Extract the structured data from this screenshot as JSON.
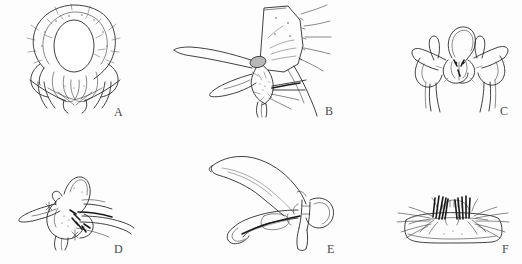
{
  "figure": {
    "type": "scientific-line-drawing-plate",
    "background_color": "#fdfdfd",
    "ink_color": "#2b2b2b",
    "rows": 2,
    "columns": 3,
    "width": 522,
    "height": 264,
    "panels": [
      {
        "label": "A",
        "subject": "head-capsule-frontal-view",
        "description": "rounded head capsule with large central oval opening and radiating setae below",
        "label_x": 114,
        "label_y": 106
      },
      {
        "label": "B",
        "subject": "maxilla-with-elongate-stylet",
        "description": "quadrangular plate bearing long curved tapering stylet and setose lower mouthparts",
        "label_x": 325,
        "label_y": 105
      },
      {
        "label": "C",
        "subject": "hypopharynx-symmetric-sclerite",
        "description": "bilaterally symmetric sclerite with central loop, lateral horn processes and two long descending setae",
        "label_x": 500,
        "label_y": 105
      },
      {
        "label": "D",
        "subject": "mouthpart-cluster-lateral-view",
        "description": "compact mouthpart cluster with pointed beak-like process and dark setae",
        "label_x": 114,
        "label_y": 243
      },
      {
        "label": "E",
        "subject": "mandible-lateral-view",
        "description": "elongate scythe-like mandible with rounded basal lobe and lower curved branch",
        "label_x": 327,
        "label_y": 243
      },
      {
        "label": "F",
        "subject": "labium-with-bristle-combs",
        "description": "broad rounded plate bearing two central combs of stout dark bristles and lateral setae",
        "label_x": 502,
        "label_y": 243
      }
    ]
  }
}
